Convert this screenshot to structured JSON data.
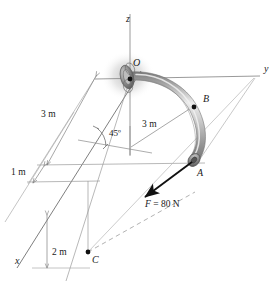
{
  "figure": {
    "type": "engineering-statics-diagram",
    "background_color": "#ffffff",
    "line_color": "#8c8c8c",
    "dark_line_color": "#404040",
    "text_color": "#1a1a1a",
    "pipe_color_light": "#e8e8e8",
    "pipe_color_mid": "#b4b4b4",
    "pipe_color_dark": "#6e6e6e"
  },
  "axes": [
    {
      "id": "x",
      "label": "x"
    },
    {
      "id": "y",
      "label": "y"
    },
    {
      "id": "z",
      "label": "z"
    }
  ],
  "points": [
    {
      "id": "O",
      "label": "O"
    },
    {
      "id": "B",
      "label": "B"
    },
    {
      "id": "A",
      "label": "A"
    },
    {
      "id": "C",
      "label": "C"
    }
  ],
  "dimensions": [
    {
      "id": "dim-left-3m",
      "label": "3 m"
    },
    {
      "id": "dim-radius-3m",
      "label": "3 m"
    },
    {
      "id": "dim-1m",
      "label": "1 m"
    },
    {
      "id": "dim-2m",
      "label": "2 m"
    }
  ],
  "angle": {
    "id": "angle-45",
    "label": "45º"
  },
  "force": {
    "id": "force-F",
    "symbol": "F",
    "equals": " = ",
    "magnitude": "80 N",
    "full_label": "F = 80 N"
  }
}
